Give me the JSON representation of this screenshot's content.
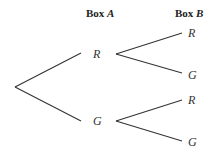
{
  "headers": {
    "box_a": {
      "prefix": "Box",
      "var": "A"
    },
    "box_b": {
      "prefix": "Box",
      "var": "B"
    }
  },
  "tree": {
    "root": {
      "x": 15,
      "y": 87
    },
    "level1": [
      {
        "label": "R",
        "branch_end": {
          "x": 81,
          "y": 53
        },
        "label_pos": {
          "x": 93,
          "y": 48
        }
      },
      {
        "label": "G",
        "branch_end": {
          "x": 81,
          "y": 121
        },
        "label_pos": {
          "x": 93,
          "y": 115
        }
      }
    ],
    "level2": [
      {
        "parent": "R",
        "label": "R",
        "branch_start": {
          "x": 116,
          "y": 54
        },
        "branch_end": {
          "x": 182,
          "y": 33
        },
        "label_pos": {
          "x": 188,
          "y": 27
        }
      },
      {
        "parent": "R",
        "label": "G",
        "branch_start": {
          "x": 116,
          "y": 54
        },
        "branch_end": {
          "x": 182,
          "y": 73
        },
        "label_pos": {
          "x": 188,
          "y": 69
        }
      },
      {
        "parent": "G",
        "label": "R",
        "branch_start": {
          "x": 116,
          "y": 121
        },
        "branch_end": {
          "x": 182,
          "y": 100
        },
        "label_pos": {
          "x": 188,
          "y": 94
        }
      },
      {
        "parent": "G",
        "label": "G",
        "branch_start": {
          "x": 116,
          "y": 121
        },
        "branch_end": {
          "x": 182,
          "y": 141
        },
        "label_pos": {
          "x": 188,
          "y": 136
        }
      }
    ]
  },
  "colors": {
    "line": "#333333",
    "text": "#333333",
    "background": "#ffffff"
  }
}
